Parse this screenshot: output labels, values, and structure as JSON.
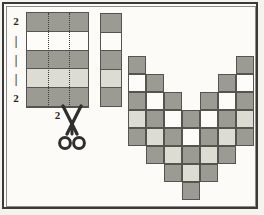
{
  "figure": {
    "kind": "pattern-diagram",
    "palette": {
      "dark": "#9b9a93",
      "light": "#dddcd3",
      "white": "#fdfcf8",
      "ink": "#55544f",
      "paper": "#fcfbf7",
      "frame": "#3a3a38"
    }
  },
  "left_grid": {
    "name": "left-swatch-grid",
    "columns": 3,
    "row_labels": [
      "2",
      "|",
      "|",
      "|",
      "2"
    ],
    "bottom_label": "2",
    "rows": [
      {
        "fill": "dark"
      },
      {
        "fill": "white"
      },
      {
        "fill": "dark"
      },
      {
        "fill": "light"
      },
      {
        "fill": "dark"
      }
    ],
    "guide_lines": "dotted-vertical"
  },
  "scissors": {
    "name": "scissors-icon",
    "label": "cut"
  },
  "mid_strip": {
    "name": "single-column-strip",
    "rows": [
      "dark",
      "white",
      "dark",
      "light",
      "dark"
    ]
  },
  "chevron": {
    "name": "v-chevron-block",
    "columns": 7,
    "rows": 9,
    "cell": 18,
    "cells": [
      {
        "col": 0,
        "row": 0,
        "fill": "dark"
      },
      {
        "col": 0,
        "row": 1,
        "fill": "white"
      },
      {
        "col": 0,
        "row": 2,
        "fill": "dark"
      },
      {
        "col": 0,
        "row": 3,
        "fill": "light"
      },
      {
        "col": 0,
        "row": 4,
        "fill": "dark"
      },
      {
        "col": 1,
        "row": 1,
        "fill": "dark"
      },
      {
        "col": 1,
        "row": 2,
        "fill": "white"
      },
      {
        "col": 1,
        "row": 3,
        "fill": "dark"
      },
      {
        "col": 1,
        "row": 4,
        "fill": "light"
      },
      {
        "col": 1,
        "row": 5,
        "fill": "dark"
      },
      {
        "col": 2,
        "row": 2,
        "fill": "dark"
      },
      {
        "col": 2,
        "row": 3,
        "fill": "white"
      },
      {
        "col": 2,
        "row": 4,
        "fill": "dark"
      },
      {
        "col": 2,
        "row": 5,
        "fill": "light"
      },
      {
        "col": 2,
        "row": 6,
        "fill": "dark"
      },
      {
        "col": 3,
        "row": 3,
        "fill": "dark"
      },
      {
        "col": 3,
        "row": 4,
        "fill": "white"
      },
      {
        "col": 3,
        "row": 5,
        "fill": "dark"
      },
      {
        "col": 3,
        "row": 6,
        "fill": "light"
      },
      {
        "col": 3,
        "row": 7,
        "fill": "dark"
      },
      {
        "col": 4,
        "row": 2,
        "fill": "dark"
      },
      {
        "col": 4,
        "row": 3,
        "fill": "white"
      },
      {
        "col": 4,
        "row": 4,
        "fill": "dark"
      },
      {
        "col": 4,
        "row": 5,
        "fill": "light"
      },
      {
        "col": 4,
        "row": 6,
        "fill": "dark"
      },
      {
        "col": 5,
        "row": 1,
        "fill": "dark"
      },
      {
        "col": 5,
        "row": 2,
        "fill": "white"
      },
      {
        "col": 5,
        "row": 3,
        "fill": "dark"
      },
      {
        "col": 5,
        "row": 4,
        "fill": "light"
      },
      {
        "col": 5,
        "row": 5,
        "fill": "dark"
      },
      {
        "col": 6,
        "row": 0,
        "fill": "dark"
      },
      {
        "col": 6,
        "row": 1,
        "fill": "white"
      },
      {
        "col": 6,
        "row": 2,
        "fill": "dark"
      },
      {
        "col": 6,
        "row": 3,
        "fill": "light"
      },
      {
        "col": 6,
        "row": 4,
        "fill": "dark"
      }
    ]
  }
}
